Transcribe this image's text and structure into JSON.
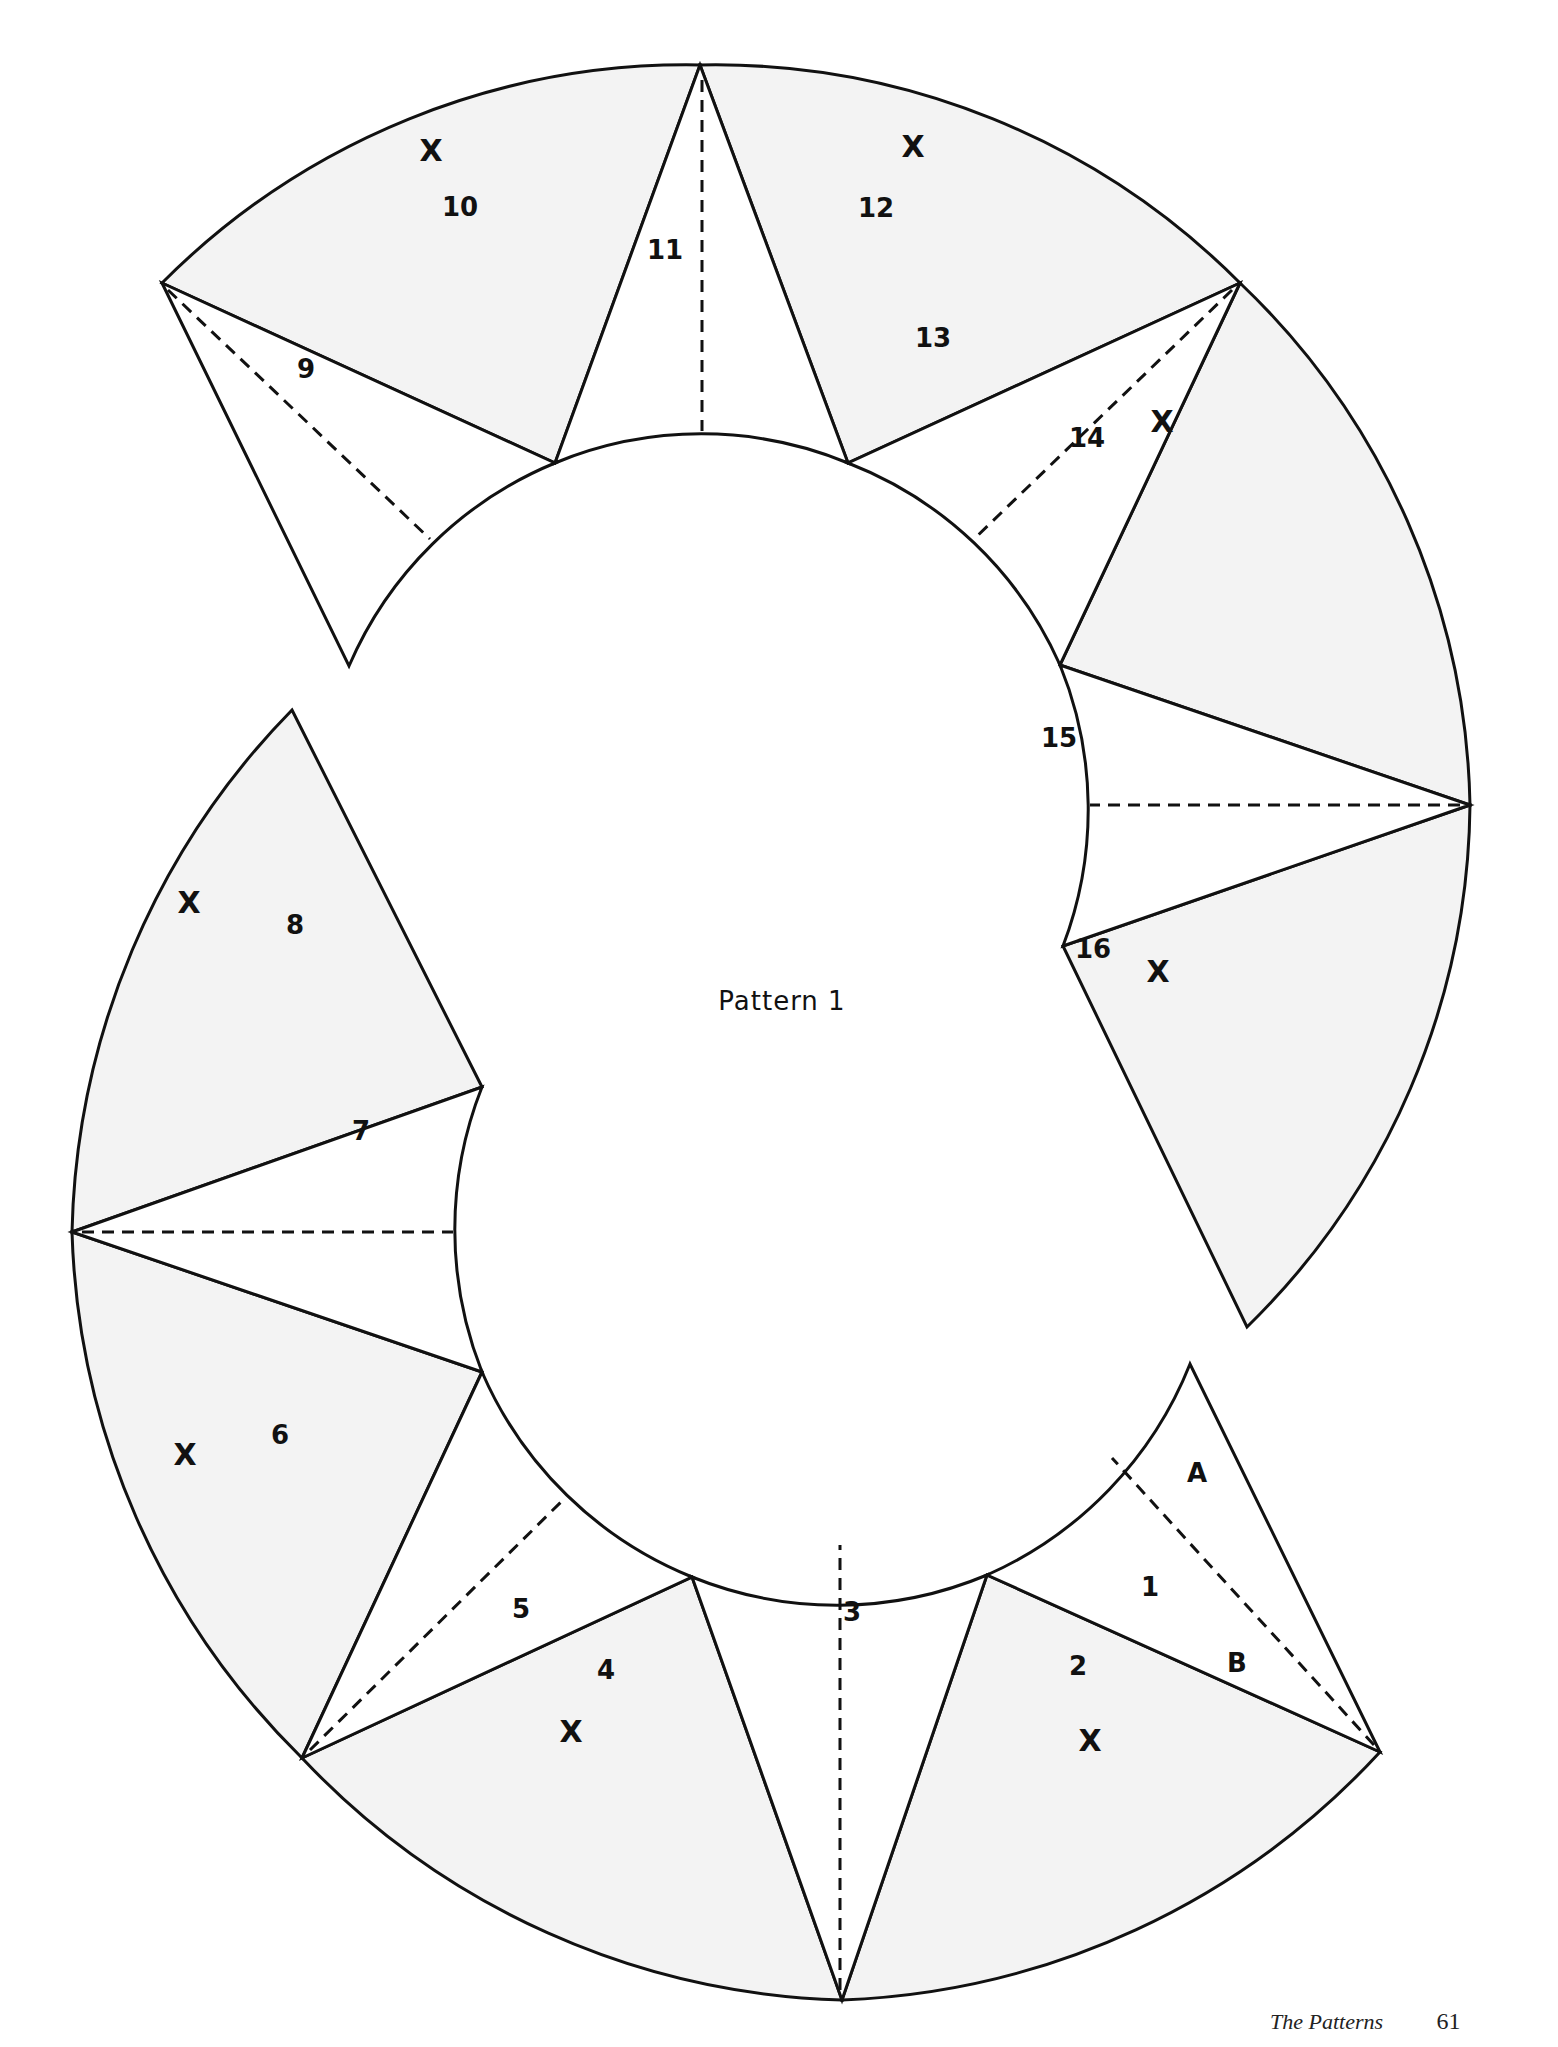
{
  "page": {
    "title": "Pattern 1",
    "footer_section": "The Patterns",
    "footer_page_number": "61"
  },
  "colors": {
    "shaded_fill": "#f3f3f3",
    "unshaded_fill": "#ffffff",
    "line": "#111111"
  },
  "pieces": [
    {
      "id": "1",
      "label": "1",
      "shaded": false,
      "label_pos": [
        1150,
        1588
      ]
    },
    {
      "id": "A",
      "label": "A",
      "shaded": false,
      "label_pos": [
        1197,
        1474
      ]
    },
    {
      "id": "2",
      "label": "2",
      "shaded": true,
      "label_pos": [
        1078,
        1667
      ],
      "x_mark": [
        1090,
        1742
      ]
    },
    {
      "id": "B",
      "label": "B",
      "shaded": true,
      "label_pos": [
        1237,
        1664
      ]
    },
    {
      "id": "3",
      "label": "3",
      "shaded": false,
      "label_pos": [
        852,
        1613
      ]
    },
    {
      "id": "4",
      "label": "4",
      "shaded": true,
      "label_pos": [
        606,
        1671
      ],
      "x_mark": [
        571,
        1733
      ]
    },
    {
      "id": "5",
      "label": "5",
      "shaded": false,
      "label_pos": [
        521,
        1610
      ]
    },
    {
      "id": "6",
      "label": "6",
      "shaded": true,
      "label_pos": [
        280,
        1436
      ],
      "x_mark": [
        185,
        1456
      ]
    },
    {
      "id": "7",
      "label": "7",
      "shaded": false,
      "label_pos": [
        361,
        1132
      ]
    },
    {
      "id": "8",
      "label": "8",
      "shaded": true,
      "label_pos": [
        295,
        926
      ],
      "x_mark": [
        189,
        904
      ]
    },
    {
      "id": "9",
      "label": "9",
      "shaded": false,
      "label_pos": [
        306,
        370
      ]
    },
    {
      "id": "10",
      "label": "10",
      "shaded": true,
      "label_pos": [
        460,
        208
      ],
      "x_mark": [
        431,
        152
      ]
    },
    {
      "id": "11",
      "label": "11",
      "shaded": false,
      "label_pos": [
        665,
        251
      ]
    },
    {
      "id": "12",
      "label": "12",
      "shaded": true,
      "label_pos": [
        876,
        209
      ],
      "x_mark": [
        913,
        148
      ]
    },
    {
      "id": "13",
      "label": "13",
      "shaded": false,
      "label_pos": [
        933,
        339
      ]
    },
    {
      "id": "14",
      "label": "14",
      "shaded": true,
      "label_pos": [
        1087,
        439
      ],
      "x_mark": [
        1162,
        423
      ]
    },
    {
      "id": "15",
      "label": "15",
      "shaded": false,
      "label_pos": [
        1059,
        739
      ]
    },
    {
      "id": "16",
      "label": "16",
      "shaded": true,
      "label_pos": [
        1093,
        950
      ],
      "x_mark": [
        1158,
        973
      ]
    }
  ],
  "x_mark_text": "X"
}
